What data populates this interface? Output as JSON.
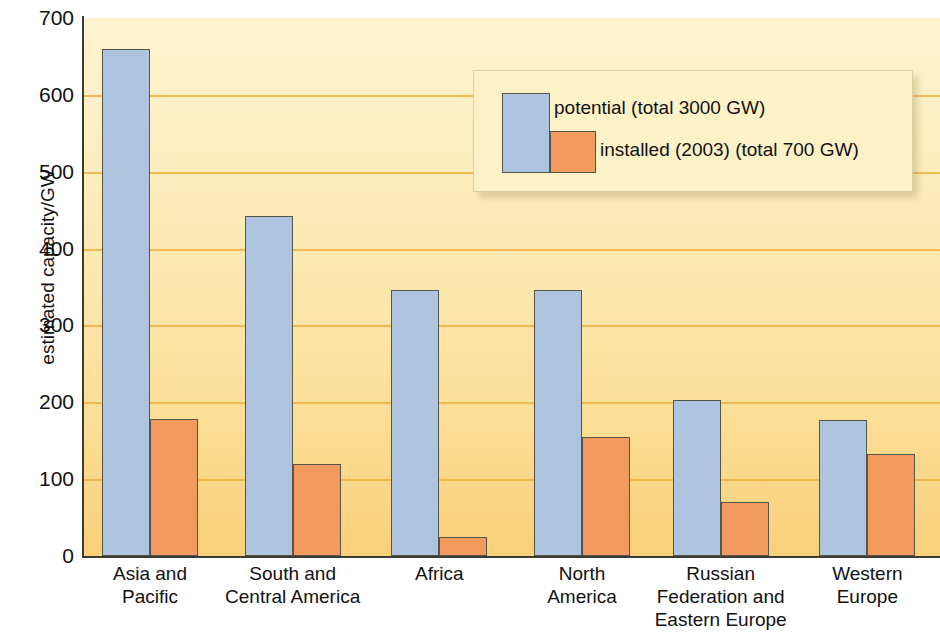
{
  "chart_data": {
    "type": "bar",
    "title": "",
    "xlabel": "",
    "ylabel": "estimated capacity/GW",
    "ylim": [
      0,
      700
    ],
    "ytick_labels": [
      "700",
      "600",
      "500",
      "400",
      "300",
      "200",
      "100",
      "0"
    ],
    "ytick_values": [
      700,
      600,
      500,
      400,
      300,
      200,
      100,
      0
    ],
    "grid": true,
    "legend_position": "top-right",
    "categories": [
      "Asia and Pacific",
      "South and Central America",
      "Africa",
      "North America",
      "Russian Federation and Eastern Europe",
      "Western Europe"
    ],
    "category_lines": [
      [
        "Asia and",
        "Pacific"
      ],
      [
        "South and",
        "Central America"
      ],
      [
        "Africa"
      ],
      [
        "North",
        "America"
      ],
      [
        "Russian",
        "Federation and",
        "Eastern Europe"
      ],
      [
        "Western",
        "Europe"
      ]
    ],
    "series": [
      {
        "name": "potential (total 3000 GW)",
        "short_name": "potential",
        "color": "#aec3de",
        "values": [
          660,
          443,
          346,
          346,
          203,
          177
        ]
      },
      {
        "name": "installed (2003) (total 700 GW)",
        "short_name": "installed (2003)",
        "color": "#f29a5e",
        "values": [
          178,
          120,
          25,
          155,
          70,
          133
        ]
      }
    ],
    "annotations": {
      "potential_total": "total 3000 GW",
      "installed_total": "total 700 GW",
      "installed_year": "2003"
    }
  },
  "axis": {
    "y_title": "estimated capacity/GW",
    "ticks": [
      "700",
      "600",
      "500",
      "400",
      "300",
      "200",
      "100",
      "0"
    ]
  },
  "legend": {
    "potential_label": "potential (total 3000 GW)",
    "installed_label": "installed (2003) (total 700 GW)"
  },
  "colors": {
    "potential_bar": "#aec3de",
    "installed_bar": "#f29a5e",
    "gridline": "#f0b040",
    "plot_background_top": "#fdf3cf",
    "plot_background_bottom": "#f9d07a",
    "axis": "#3b3b33",
    "text": "#111111"
  }
}
